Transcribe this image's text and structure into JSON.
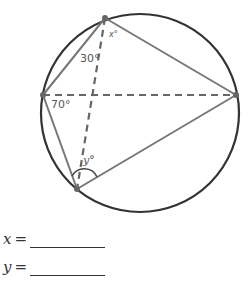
{
  "diagram": {
    "circle": {
      "cx": 140,
      "cy": 113,
      "r": 99
    },
    "points": {
      "top": {
        "x": 105,
        "y": 18
      },
      "left": {
        "x": 43,
        "y": 95
      },
      "right": {
        "x": 236,
        "y": 95
      },
      "bottom": {
        "x": 77,
        "y": 189
      }
    },
    "labels": {
      "x_angle": "x°",
      "angle_30": "30°",
      "angle_70": "70°",
      "y_angle": "y°"
    },
    "colors": {
      "circle": "#333333",
      "solid_lines": "#777777",
      "dashed_lines": "#666666",
      "points": "#666666"
    }
  },
  "answers": [
    {
      "variable": "x",
      "equals": "=",
      "value": ""
    },
    {
      "variable": "y",
      "equals": "=",
      "value": ""
    }
  ]
}
